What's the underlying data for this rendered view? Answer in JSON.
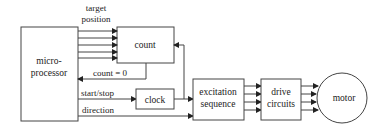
{
  "diagram": {
    "blocks": {
      "microprocessor": {
        "line1": "micro-",
        "line2": "processor"
      },
      "count": {
        "label": "count"
      },
      "clock": {
        "label": "clock"
      },
      "excitation": {
        "line1": "excitation",
        "line2": "sequence"
      },
      "drive": {
        "line1": "drive",
        "line2": "circuits"
      },
      "motor": {
        "label": "motor"
      }
    },
    "signals": {
      "target_position_line1": "target",
      "target_position_line2": "position",
      "count_zero": "count  =  0",
      "start_stop": "start/stop",
      "direction": "direction"
    },
    "colors": {
      "stroke": "#444444",
      "text": "#222222",
      "background": "#ffffff"
    }
  }
}
